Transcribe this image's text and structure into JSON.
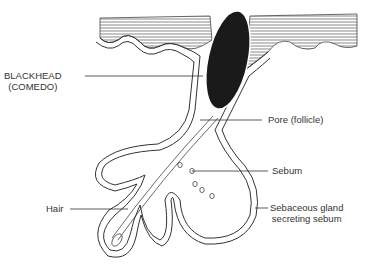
{
  "diagram": {
    "title": "",
    "labels": {
      "blackhead_line1": "BLACKHEAD",
      "blackhead_line2": "(COMEDO)",
      "pore": "Pore (follicle)",
      "sebum": "Sebum",
      "hair": "Hair",
      "gland_line1": "Sebaceous gland",
      "gland_line2": "secreting sebum"
    },
    "colors": {
      "line": "#333333",
      "blackhead": "#1a1a1a",
      "background": "#ffffff"
    }
  }
}
